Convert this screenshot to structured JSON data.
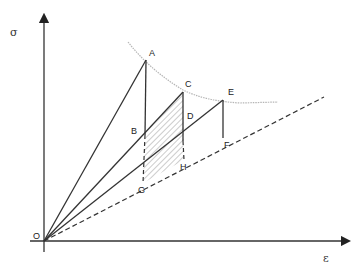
{
  "diagram": {
    "type": "stress-strain construction",
    "axes": {
      "y_label": "σ",
      "x_label": "ε",
      "origin_label": "O"
    },
    "points": {
      "O": {
        "label": "O",
        "x": 44,
        "y": 241
      },
      "A": {
        "label": "A",
        "x": 146,
        "y": 60
      },
      "B": {
        "label": "B",
        "x": 145,
        "y": 135
      },
      "C": {
        "label": "C",
        "x": 183,
        "y": 92
      },
      "D": {
        "label": "D",
        "x": 183,
        "y": 141
      },
      "E": {
        "label": "E",
        "x": 223,
        "y": 100
      },
      "F": {
        "label": "F",
        "x": 223,
        "y": 138
      },
      "G": {
        "label": "G",
        "x": 143,
        "y": 183
      },
      "H": {
        "label": "H",
        "x": 184,
        "y": 160
      }
    },
    "lines": [
      {
        "from": "O",
        "to": "A",
        "style": "solid"
      },
      {
        "from": "A",
        "to": "B",
        "style": "solid"
      },
      {
        "from": "O",
        "to": "C",
        "style": "solid"
      },
      {
        "from": "C",
        "to": "D",
        "style": "solid"
      },
      {
        "from": "O",
        "to": "E",
        "style": "solid"
      },
      {
        "from": "E",
        "to": "F",
        "style": "solid"
      },
      {
        "from": "B",
        "to": "G",
        "style": "dashed"
      },
      {
        "from": "D",
        "to": "H",
        "style": "dashed"
      },
      {
        "from": "O",
        "to": "end",
        "style": "dashed",
        "description": "reference line through G, H, F"
      }
    ],
    "curve": {
      "description": "dotted envelope curve through A, C, E",
      "color": "#b0b0b0"
    },
    "hatched_region": {
      "vertices": [
        "B",
        "C",
        "H",
        "G"
      ],
      "pattern": "diagonal hatching"
    },
    "colors": {
      "line": "#333333",
      "envelope": "#b5b5b5",
      "hatch": "#9a9a9a"
    }
  }
}
